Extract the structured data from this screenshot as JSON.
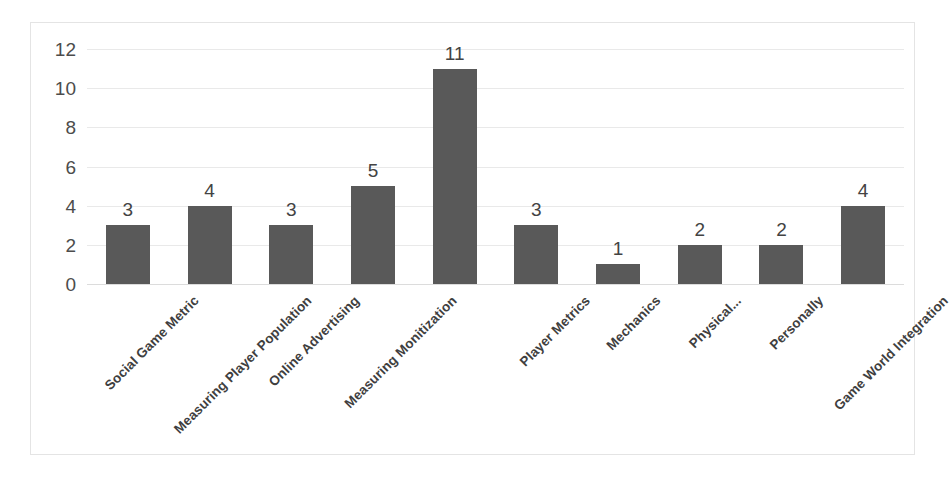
{
  "chart_data": {
    "type": "bar",
    "title": "",
    "subtitle": "",
    "xlabel": "",
    "ylabel": "",
    "ylim": [
      0,
      12
    ],
    "ytick_step": 2,
    "yticks": [
      12,
      10,
      8,
      6,
      4,
      2,
      0
    ],
    "grid": true,
    "legend": false,
    "legend_position": "none",
    "data_labels": true,
    "orientation": "vertical",
    "bar_color": "#595959",
    "gridline_color": "#e9e9e9",
    "plot_background": "#ffffff",
    "border_color": "#e4e4e4",
    "categories": [
      "Social Game Metric",
      "Measuring Player Population",
      "Online Advertising",
      "Measuring Monitization",
      "",
      "Player Metrics",
      "Mechanics",
      "Physical...",
      "Personally",
      "Game World Integration"
    ],
    "values": [
      3,
      4,
      3,
      5,
      11,
      3,
      1,
      2,
      2,
      4
    ],
    "bars": [
      {
        "category": "Social Game Metric",
        "value": 3,
        "label": "3"
      },
      {
        "category": "Measuring Player Population",
        "value": 4,
        "label": "4"
      },
      {
        "category": "Online Advertising",
        "value": 3,
        "label": "3"
      },
      {
        "category": "Measuring Monitization",
        "value": 5,
        "label": "5"
      },
      {
        "category": "",
        "value": 11,
        "label": "11"
      },
      {
        "category": "Player Metrics",
        "value": 3,
        "label": "3"
      },
      {
        "category": "Mechanics",
        "value": 1,
        "label": "1"
      },
      {
        "category": "Physical...",
        "value": 2,
        "label": "2"
      },
      {
        "category": "Personally",
        "value": 2,
        "label": "2"
      },
      {
        "category": "Game World Integration",
        "value": 4,
        "label": "4"
      }
    ]
  }
}
